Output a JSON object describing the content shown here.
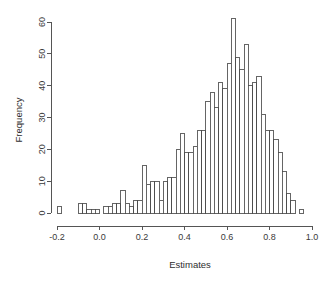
{
  "chart_data": {
    "type": "bar",
    "subtype": "histogram",
    "title": "",
    "xlabel": "Estimates",
    "ylabel": "Frequency",
    "xlim": [
      -0.2,
      1.0
    ],
    "ylim": [
      0,
      61
    ],
    "grid": false,
    "legend": null,
    "bin_width": 0.02,
    "x_ticks": [
      "-0.2",
      "0.0",
      "0.2",
      "0.4",
      "0.6",
      "0.8",
      "1.0"
    ],
    "x_tick_values": [
      -0.2,
      0.0,
      0.2,
      0.4,
      0.6,
      0.8,
      1.0
    ],
    "y_ticks": [
      "0",
      "10",
      "20",
      "30",
      "40",
      "50",
      "60"
    ],
    "y_tick_values": [
      0,
      10,
      20,
      30,
      40,
      50,
      60
    ],
    "bin_starts": [
      -0.2,
      -0.18,
      -0.16,
      -0.14,
      -0.12,
      -0.1,
      -0.08,
      -0.06,
      -0.04,
      -0.02,
      0.0,
      0.02,
      0.04,
      0.06,
      0.08,
      0.1,
      0.12,
      0.14,
      0.16,
      0.18,
      0.2,
      0.22,
      0.24,
      0.26,
      0.28,
      0.3,
      0.32,
      0.34,
      0.36,
      0.38,
      0.4,
      0.42,
      0.44,
      0.46,
      0.48,
      0.5,
      0.52,
      0.54,
      0.56,
      0.58,
      0.6,
      0.62,
      0.64,
      0.66,
      0.68,
      0.7,
      0.72,
      0.74,
      0.76,
      0.78,
      0.8,
      0.82,
      0.84,
      0.86,
      0.88,
      0.9,
      0.92,
      0.94
    ],
    "values": [
      2,
      0,
      0,
      0,
      0,
      3,
      3,
      1,
      1,
      1,
      0,
      2,
      2,
      3,
      3,
      7,
      3,
      2,
      4,
      4,
      15,
      9,
      10,
      10,
      4,
      10,
      11,
      11,
      20,
      25,
      19,
      19,
      21,
      26,
      26,
      35,
      38,
      33,
      41,
      39,
      47,
      61,
      49,
      45,
      53,
      40,
      41,
      43,
      31,
      26,
      26,
      23,
      19,
      13,
      6,
      4,
      0,
      1
    ],
    "axis_color": "#555555",
    "bar_fill": "#ffffff",
    "bar_stroke": "#4a4a4a",
    "background": "#ffffff"
  }
}
